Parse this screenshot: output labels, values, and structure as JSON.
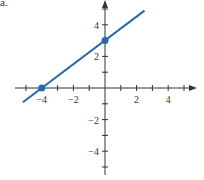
{
  "label": "a.",
  "colors": {
    "line": "#2a68a8",
    "axis": "#333333"
  },
  "chart_data": {
    "type": "line",
    "title": "",
    "xlabel": "",
    "ylabel": "",
    "xlim": [
      -6,
      5.7
    ],
    "ylim": [
      -5.5,
      6
    ],
    "x_ticks": [
      -5,
      -4,
      -3,
      -2,
      -1,
      1,
      2,
      3,
      4,
      5
    ],
    "y_ticks": [
      -5,
      -4,
      -3,
      -2,
      -1,
      1,
      2,
      3,
      4,
      5
    ],
    "x_tick_labels": [
      "-4",
      "-2",
      "2",
      "4"
    ],
    "y_tick_labels": [
      "4",
      "2",
      "-2",
      "-4"
    ],
    "grid": false,
    "series": [
      {
        "name": "line",
        "x": [
          -5.2,
          2.5
        ],
        "y": [
          -0.9,
          4.9
        ]
      }
    ],
    "points": [
      {
        "x": -4,
        "y": 0
      },
      {
        "x": 0,
        "y": 3
      }
    ]
  }
}
